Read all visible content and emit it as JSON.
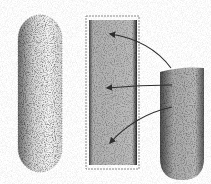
{
  "figure": {
    "colors": {
      "background": "#ffffff",
      "pale_cell_fill": "#f1f1f1",
      "pale_cell_stipple": "#3a3a3a",
      "panel_border": "#8a8a8a",
      "panel_fill": "#b9b9b9",
      "panel_edge_dark": "#2a2a2a",
      "dark_cell_fill": "#b3b3b3",
      "dark_cell_edge": "#3a3a3a",
      "arrow": "#3a3a3a"
    },
    "shapes": [
      {
        "id": "pale-cell",
        "type": "capsule",
        "x": 18,
        "y": 15,
        "w": 44,
        "h": 157
      },
      {
        "id": "panel",
        "type": "rect",
        "x": 86,
        "y": 16,
        "w": 53,
        "h": 153
      },
      {
        "id": "dark-cell",
        "type": "capsule-flat-top",
        "x": 160,
        "y": 68,
        "w": 44,
        "h": 112
      }
    ],
    "arrows": [
      {
        "from": [
          171,
          68
        ],
        "to": [
          109,
          34
        ],
        "curve": "up"
      },
      {
        "from": [
          172,
          85
        ],
        "to": [
          106,
          88
        ],
        "curve": "straight"
      },
      {
        "from": [
          172,
          107
        ],
        "to": [
          109,
          144
        ],
        "curve": "down"
      }
    ]
  }
}
